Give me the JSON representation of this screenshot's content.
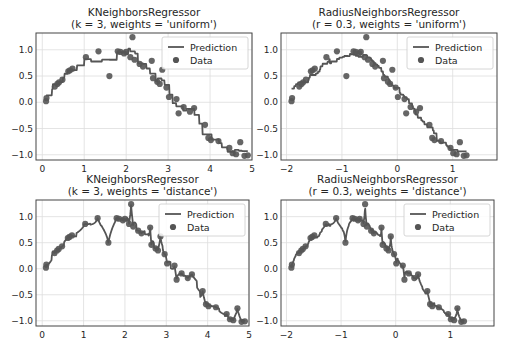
{
  "figure": {
    "width": 513,
    "height": 352,
    "background": "#ffffff"
  },
  "style": {
    "line_color": "#555555",
    "marker_color": "#555555",
    "grid_color": "#dddddd",
    "spine_color": "#444444",
    "legend_border": "#cccccc"
  },
  "legend": {
    "prediction_label": "Prediction",
    "data_label": "Data"
  },
  "chart_data": [
    {
      "type": "line+scatter",
      "id": "knn-uniform",
      "title": "KNeighborsRegressor\n(k = 3, weights = 'uniform')",
      "title_lines": [
        "KNeighborsRegressor",
        "(k = 3, weights = 'uniform')"
      ],
      "xlim": [
        -0.15,
        5.0
      ],
      "ylim": [
        -1.1,
        1.32
      ],
      "xticks": [
        0,
        1,
        2,
        3,
        4,
        5
      ],
      "yticks": [
        1.0,
        0.5,
        0.0,
        -0.5,
        -1.0
      ],
      "ytick_labels": [
        "1.0",
        "0.5",
        "0.0",
        "−0.5",
        "−1.0"
      ],
      "legend_position": "upper right",
      "grid": true,
      "plot_box": {
        "left": 36,
        "top": 33,
        "right": 252,
        "bottom": 160
      },
      "prediction_style": "step",
      "k": 3,
      "weights": "uniform"
    },
    {
      "type": "line+scatter",
      "id": "radius-uniform",
      "title_lines": [
        "RadiusNeighborsRegressor",
        "(r = 0.3, weights = 'uniform')"
      ],
      "xlim": [
        -2.1,
        1.8
      ],
      "ylim": [
        -1.1,
        1.32
      ],
      "xticks": [
        -2,
        -1,
        0,
        1
      ],
      "xtick_labels": [
        "−2",
        "−1",
        "0",
        "1"
      ],
      "yticks": [
        1.0,
        0.5,
        0.0,
        -0.5,
        -1.0
      ],
      "ytick_labels": [
        "1.0",
        "0.5",
        "0.0",
        "−0.5",
        "−1.0"
      ],
      "legend_position": "upper right",
      "grid": true,
      "plot_box": {
        "left": 281,
        "top": 33,
        "right": 497,
        "bottom": 160
      },
      "prediction_style": "step",
      "radius": 0.3,
      "weights": "uniform"
    },
    {
      "type": "line+scatter",
      "id": "knn-distance",
      "title_lines": [
        "KNeighborsRegressor",
        "(k = 3, weights = 'distance')"
      ],
      "xlim": [
        -0.15,
        5.0
      ],
      "ylim": [
        -1.1,
        1.32
      ],
      "xticks": [
        0,
        1,
        2,
        3,
        4,
        5
      ],
      "yticks": [
        1.0,
        0.5,
        0.0,
        -0.5,
        -1.0
      ],
      "ytick_labels": [
        "1.0",
        "0.5",
        "0.0",
        "−0.5",
        "−1.0"
      ],
      "legend_position": "upper right",
      "grid": true,
      "plot_box": {
        "left": 36,
        "top": 200,
        "right": 249,
        "bottom": 326
      },
      "prediction_style": "interpolate",
      "k": 3,
      "weights": "distance"
    },
    {
      "type": "line+scatter",
      "id": "radius-distance",
      "title_lines": [
        "RadiusNeighborsRegressor",
        "(r = 0.3, weights = 'distance')"
      ],
      "xlim": [
        -2.1,
        1.8
      ],
      "ylim": [
        -1.1,
        1.32
      ],
      "xticks": [
        -2,
        -1,
        0,
        1
      ],
      "xtick_labels": [
        "−2",
        "−1",
        "0",
        "1"
      ],
      "yticks": [
        1.0,
        0.5,
        0.0,
        -0.5,
        -1.0
      ],
      "ytick_labels": [
        "1.0",
        "0.5",
        "0.0",
        "−0.5",
        "−1.0"
      ],
      "legend_position": "upper right",
      "grid": true,
      "plot_box": {
        "left": 281,
        "top": 200,
        "right": 494,
        "bottom": 326
      },
      "prediction_style": "interpolate",
      "radius": 0.3,
      "weights": "distance"
    }
  ],
  "data_points": {
    "x_knn": [
      0.09,
      0.1,
      0.3,
      0.36,
      0.4,
      0.48,
      0.62,
      0.66,
      0.72,
      1.04,
      1.34,
      1.6,
      1.8,
      1.86,
      1.95,
      2.0,
      2.1,
      2.15,
      2.2,
      2.32,
      2.4,
      2.61,
      2.64,
      2.74,
      2.8,
      2.86,
      2.96,
      3.02,
      3.2,
      3.25,
      3.37,
      3.52,
      3.62,
      3.88,
      3.96,
      4.02,
      4.2,
      4.46,
      4.54,
      4.62,
      4.72,
      4.82,
      4.9
    ],
    "x_radius": [
      -1.91,
      -1.9,
      -1.77,
      -1.73,
      -1.7,
      -1.65,
      -1.56,
      -1.53,
      -1.49,
      -1.28,
      -1.09,
      -0.92,
      -0.79,
      -0.75,
      -0.69,
      -0.66,
      -0.59,
      -0.56,
      -0.53,
      -0.45,
      -0.4,
      -0.26,
      -0.24,
      -0.17,
      -0.13,
      -0.09,
      -0.03,
      0.01,
      0.13,
      0.16,
      0.24,
      0.34,
      0.41,
      0.58,
      0.63,
      0.67,
      0.79,
      0.96,
      1.01,
      1.07,
      1.13,
      1.2,
      1.25
    ],
    "y": [
      0.02,
      0.08,
      0.3,
      0.35,
      0.38,
      0.43,
      0.59,
      0.61,
      0.64,
      0.86,
      0.97,
      0.5,
      0.97,
      0.96,
      0.93,
      0.96,
      0.86,
      1.24,
      0.81,
      0.73,
      0.68,
      0.79,
      0.46,
      0.39,
      0.35,
      0.62,
      0.28,
      0.1,
      0.06,
      -0.21,
      -0.09,
      -0.18,
      -0.11,
      -0.43,
      -0.68,
      -0.72,
      -0.74,
      -0.87,
      -0.97,
      -0.99,
      -0.76,
      -1.02,
      -1.01,
      -0.99
    ]
  }
}
